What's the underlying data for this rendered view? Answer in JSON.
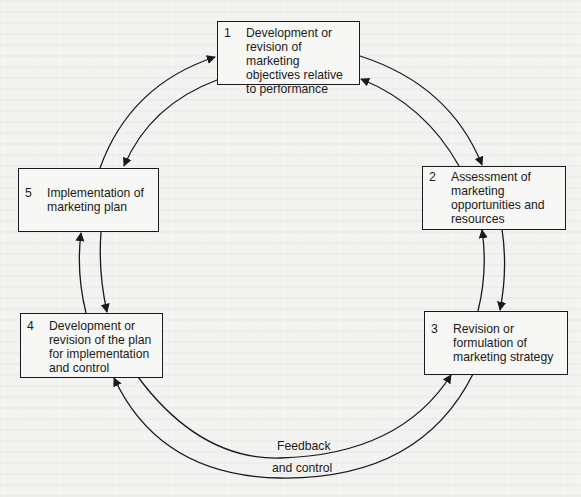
{
  "diagram": {
    "type": "cycle",
    "steps": [
      {
        "number": "1",
        "text": "Development or revision of marketing objectives relative to performance"
      },
      {
        "number": "2",
        "text": "Assessment of marketing opportunities and resources"
      },
      {
        "number": "3",
        "text": "Revision or formulation of marketing strategy"
      },
      {
        "number": "4",
        "text": "Development or revision of the plan for implementation and control"
      },
      {
        "number": "5",
        "text": "Implementation of marketing plan"
      }
    ],
    "feedback_label_line1": "Feedback",
    "feedback_label_line2": "and control",
    "edges": [
      {
        "from": "1",
        "to": "2"
      },
      {
        "from": "2",
        "to": "1"
      },
      {
        "from": "2",
        "to": "3"
      },
      {
        "from": "3",
        "to": "2"
      },
      {
        "from": "3",
        "to": "4"
      },
      {
        "from": "4",
        "to": "3"
      },
      {
        "from": "4",
        "to": "5"
      },
      {
        "from": "5",
        "to": "4"
      },
      {
        "from": "5",
        "to": "1"
      },
      {
        "from": "1",
        "to": "5"
      }
    ],
    "colors": {
      "line": "#1a1a1a",
      "background": "#f3f3f1"
    }
  }
}
